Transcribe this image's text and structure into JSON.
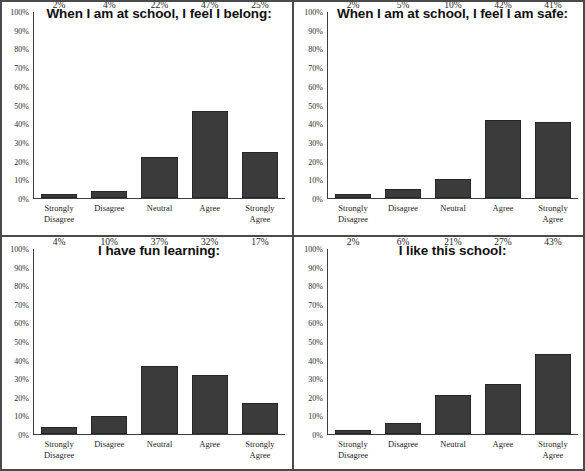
{
  "chart_data": [
    {
      "type": "bar",
      "title": "When I am at school, I feel I belong:",
      "categories": [
        "Strongly\nDisagree",
        "Disagree",
        "Neutral",
        "Agree",
        "Strongly\nAgree"
      ],
      "values": [
        2,
        4,
        22,
        47,
        25
      ],
      "value_labels": [
        "2%",
        "4%",
        "22%",
        "47%",
        "25%"
      ],
      "xlabel": "",
      "ylabel": "",
      "ylim": [
        0,
        100
      ],
      "yticks": [
        100,
        90,
        80,
        70,
        60,
        50,
        40,
        30,
        20,
        10,
        0
      ],
      "ytick_labels": [
        "100%",
        "90%",
        "80%",
        "70%",
        "60%",
        "50%",
        "40%",
        "30%",
        "20%",
        "10%",
        "0%"
      ],
      "grid": false,
      "legend": false,
      "bar_color": "#3b3b3b"
    },
    {
      "type": "bar",
      "title": "When I am at school, I feel I am safe:",
      "categories": [
        "Strongly\nDisagree",
        "Disagree",
        "Neutral",
        "Agree",
        "Strongly\nAgree"
      ],
      "values": [
        2,
        5,
        10,
        42,
        41
      ],
      "value_labels": [
        "2%",
        "5%",
        "10%",
        "42%",
        "41%"
      ],
      "xlabel": "",
      "ylabel": "",
      "ylim": [
        0,
        100
      ],
      "yticks": [
        100,
        90,
        80,
        70,
        60,
        50,
        40,
        30,
        20,
        10,
        0
      ],
      "ytick_labels": [
        "100%",
        "90%",
        "80%",
        "70%",
        "60%",
        "50%",
        "40%",
        "30%",
        "20%",
        "10%",
        "0%"
      ],
      "grid": false,
      "legend": false,
      "bar_color": "#3b3b3b"
    },
    {
      "type": "bar",
      "title": "I have fun learning:",
      "categories": [
        "Strongly\nDisagree",
        "Disagree",
        "Neutral",
        "Agree",
        "Strongly\nAgree"
      ],
      "values": [
        4,
        10,
        37,
        32,
        17
      ],
      "value_labels": [
        "4%",
        "10%",
        "37%",
        "32%",
        "17%"
      ],
      "xlabel": "",
      "ylabel": "",
      "ylim": [
        0,
        100
      ],
      "yticks": [
        100,
        90,
        80,
        70,
        60,
        50,
        40,
        30,
        20,
        10,
        0
      ],
      "ytick_labels": [
        "100%",
        "90%",
        "80%",
        "70%",
        "60%",
        "50%",
        "40%",
        "30%",
        "20%",
        "10%",
        "0%"
      ],
      "grid": false,
      "legend": false,
      "bar_color": "#3b3b3b"
    },
    {
      "type": "bar",
      "title": "I like this school:",
      "categories": [
        "Strongly\nDisagree",
        "Disagree",
        "Neutral",
        "Agree",
        "Strongly\nAgree"
      ],
      "values": [
        2,
        6,
        21,
        27,
        43
      ],
      "value_labels": [
        "2%",
        "6%",
        "21%",
        "27%",
        "43%"
      ],
      "xlabel": "",
      "ylabel": "",
      "ylim": [
        0,
        100
      ],
      "yticks": [
        100,
        90,
        80,
        70,
        60,
        50,
        40,
        30,
        20,
        10,
        0
      ],
      "ytick_labels": [
        "100%",
        "90%",
        "80%",
        "70%",
        "60%",
        "50%",
        "40%",
        "30%",
        "20%",
        "10%",
        "0%"
      ],
      "grid": false,
      "legend": false,
      "bar_color": "#3b3b3b"
    }
  ]
}
